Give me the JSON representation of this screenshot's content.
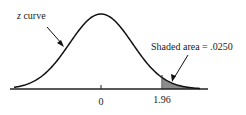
{
  "diagram": {
    "curve_label_var": "z",
    "curve_label_rest": " curve",
    "shaded_label": "Shaded area = .0250",
    "ticks": [
      {
        "label": "0",
        "value": 0
      },
      {
        "label": "1.96",
        "value": 1.96
      }
    ],
    "colors": {
      "curve": "#111111",
      "axis": "#222222",
      "shade": "#8c8c8c"
    }
  },
  "chart_data": {
    "type": "area",
    "title": "",
    "distribution": "standard normal (z curve)",
    "x_ticks": [
      0,
      1.96
    ],
    "shaded_region": {
      "from": 1.96,
      "to": "infinity",
      "area": 0.025
    },
    "annotations": [
      "z curve",
      "Shaded area = .0250"
    ]
  }
}
